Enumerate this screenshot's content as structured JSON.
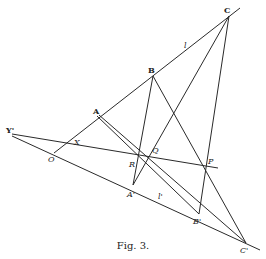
{
  "figure": {
    "caption": "Fig. 3.",
    "points": {
      "C": {
        "label": "C",
        "x": 229,
        "y": 16
      },
      "B": {
        "label": "B",
        "x": 153,
        "y": 76
      },
      "A": {
        "label": "A",
        "x": 97,
        "y": 116
      },
      "O": {
        "label": "O",
        "x": 54,
        "y": 153
      },
      "Y1": {
        "label": "Y'",
        "x": 12,
        "y": 135
      },
      "X": {
        "label": "X",
        "x": 74,
        "y": 142
      },
      "R": {
        "label": "R",
        "x": 138,
        "y": 155
      },
      "Q": {
        "label": "Q",
        "x": 150,
        "y": 156
      },
      "P": {
        "label": "P",
        "x": 207,
        "y": 166
      },
      "A1": {
        "label": "A'",
        "x": 133,
        "y": 185
      },
      "B1": {
        "label": "B'",
        "x": 199,
        "y": 214
      },
      "C1": {
        "label": "C'",
        "x": 246,
        "y": 243
      }
    },
    "line_labels": {
      "l": {
        "label": "l",
        "x": 186,
        "y": 49
      },
      "l1": {
        "label": "l'",
        "x": 160,
        "y": 200
      }
    }
  }
}
